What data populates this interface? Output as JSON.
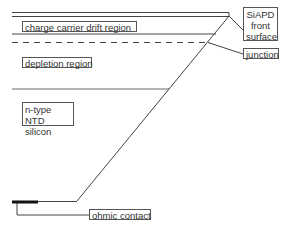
{
  "diagram": {
    "title": "",
    "labels": {
      "charge_carrier": "charge carrier drift region",
      "depletion": "depletion region",
      "ntype": "n-type NTD\nsilicon",
      "siapd": "SiAPD\nfront\nsurface",
      "junction": "junction",
      "ohmic": "ohmic contact"
    },
    "colors": {
      "line": "#444444",
      "contact": "#111111",
      "text": "#333333",
      "background": "#ffffff"
    }
  }
}
